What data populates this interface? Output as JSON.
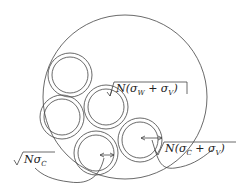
{
  "diagram": {
    "outer_circle": {
      "cx": 125,
      "cy": 97,
      "r": 82
    },
    "annuli": [
      {
        "name": "annulus-top-left",
        "cx": 70,
        "cy": 75,
        "r_outer": 22,
        "r_inner": 18
      },
      {
        "name": "annulus-mid-left",
        "cx": 62,
        "cy": 117,
        "r_outer": 22,
        "r_inner": 18
      },
      {
        "name": "annulus-center",
        "cx": 106,
        "cy": 107,
        "r_outer": 22,
        "r_inner": 18
      },
      {
        "name": "annulus-bottom",
        "cx": 96,
        "cy": 153,
        "r_outer": 22,
        "r_inner": 18
      },
      {
        "name": "annulus-right",
        "cx": 140,
        "cy": 140,
        "r_outer": 22,
        "r_inner": 18
      }
    ],
    "labels": {
      "wv": {
        "prefix": "N(σ",
        "sub1": "W",
        "mid": " + σ",
        "sub2": "V",
        "suffix": ")"
      },
      "cv": {
        "prefix": "N(σ",
        "sub1": "C",
        "mid": " + σ",
        "sub2": "V",
        "suffix": ")"
      },
      "c": {
        "prefix": "Nσ",
        "sub1": "C"
      }
    },
    "stroke_color": "#444444"
  }
}
